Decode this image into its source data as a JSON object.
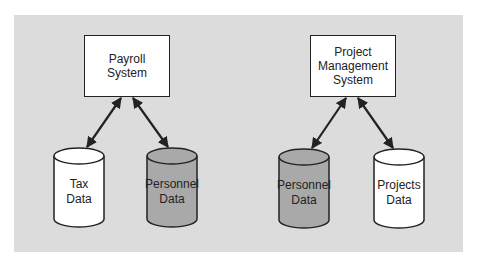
{
  "diagram": {
    "left_system": {
      "title_lines": [
        "Payroll",
        "System"
      ],
      "databases": [
        {
          "lines": [
            "Tax",
            "Data"
          ],
          "fill": "#ffffff"
        },
        {
          "lines": [
            "Personnel",
            "Data"
          ],
          "fill": "#a9a9a9"
        }
      ]
    },
    "right_system": {
      "title_lines": [
        "Project",
        "Management",
        "System"
      ],
      "databases": [
        {
          "lines": [
            "Personnel",
            "Data"
          ],
          "fill": "#a9a9a9"
        },
        {
          "lines": [
            "Projects",
            "Data"
          ],
          "fill": "#ffffff"
        }
      ]
    },
    "colors": {
      "panel": "#dcdcdc",
      "stroke": "#222222",
      "shared_db": "#a9a9a9"
    }
  }
}
